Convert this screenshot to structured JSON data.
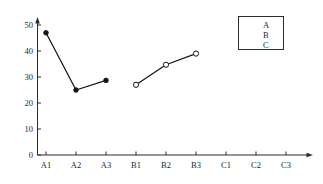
{
  "chart_data": {
    "type": "line",
    "title": "",
    "subtitle": "",
    "xlabel": "",
    "ylabel": "",
    "grid": false,
    "legend_position": "top-right",
    "categories": [
      "A1",
      "A2",
      "A3",
      "B1",
      "B2",
      "B3",
      "C1",
      "C2",
      "C3"
    ],
    "xlim": [
      0,
      10
    ],
    "ylim": [
      0,
      52
    ],
    "yticks": [
      0,
      10,
      20,
      30,
      40,
      50
    ],
    "ytick_labels": [
      "0",
      "10",
      "20",
      "30",
      "40",
      "50"
    ],
    "axis_style": "arrow-terminated",
    "series": [
      {
        "name": "A",
        "marker": "filled-circle",
        "x": [
          "A1",
          "A2",
          "A3"
        ],
        "values": [
          47,
          25,
          28.7
        ]
      },
      {
        "name": "B",
        "marker": "open-circle",
        "x": [
          "B1",
          "B2",
          "B3"
        ],
        "values": [
          27,
          34.7,
          39
        ]
      },
      {
        "name": "C",
        "marker": "star",
        "x": [
          "C1",
          "C2",
          "C3"
        ],
        "values": [
          24,
          33.5,
          42
        ]
      }
    ],
    "colors": {
      "line": "#141414",
      "axis": "#2b2b2b",
      "text": "#1f1f1f",
      "background": "#ffffff"
    }
  },
  "legend": {
    "entries": [
      {
        "label": "A",
        "marker": "filled-circle"
      },
      {
        "label": "B",
        "marker": "open-circle"
      },
      {
        "label": "C",
        "marker": "star"
      }
    ]
  },
  "axes": {
    "y_tick_labels": [
      "50",
      "40",
      "30",
      "20",
      "10",
      "0"
    ],
    "x_tick_labels": [
      "A1",
      "A2",
      "A3",
      "B1",
      "B2",
      "B3",
      "C1",
      "C2",
      "C3"
    ]
  }
}
